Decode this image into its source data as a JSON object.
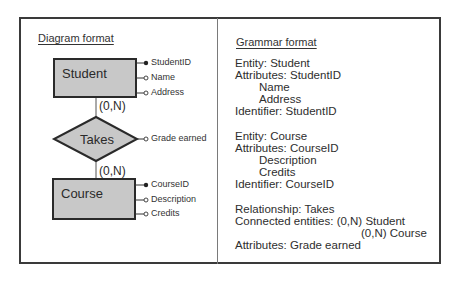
{
  "diagram": {
    "heading": "Diagram format",
    "entities": [
      {
        "name": "Student",
        "attributes": [
          {
            "label": "StudentID",
            "identifier": true
          },
          {
            "label": "Name",
            "identifier": false
          },
          {
            "label": "Address",
            "identifier": false
          }
        ]
      },
      {
        "name": "Course",
        "attributes": [
          {
            "label": "CourseID",
            "identifier": true
          },
          {
            "label": "Description",
            "identifier": false
          },
          {
            "label": "Credits",
            "identifier": false
          }
        ]
      }
    ],
    "relationship": {
      "name": "Takes",
      "attribute": "Grade earned",
      "cardinality_top": "(0,N)",
      "cardinality_bottom": "(0,N)"
    },
    "colors": {
      "fill": "#c8c8c8",
      "stroke": "#2a2a2a",
      "text": "#2e2e2e"
    }
  },
  "grammar": {
    "heading": "Grammar format",
    "lines": [
      "Entity: Student",
      "Attributes: StudentID",
      "Name",
      "Address",
      "Identifier: StudentID",
      "Entity: Course",
      "Attributes: CourseID",
      "Description",
      "Credits",
      "Identifier: CourseID",
      "Relationship: Takes",
      "Connected entities: (0,N) Student",
      "(0,N) Course",
      "Attributes: Grade earned"
    ]
  }
}
